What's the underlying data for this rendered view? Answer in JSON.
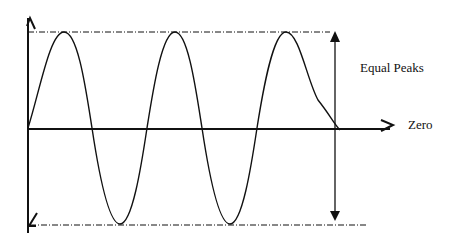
{
  "diagram": {
    "labels": {
      "equal_peaks": "Equal Peaks",
      "zero": "Zero"
    },
    "wave": {
      "cycles": 3,
      "peaks_x": [
        64,
        175,
        286
      ],
      "troughs_x": [
        120,
        230
      ],
      "zero_line_y": 128,
      "upper_peak_line_y": 32,
      "lower_peak_line_y": 224
    },
    "colors": {
      "line": "#111111",
      "background": "#ffffff"
    }
  }
}
